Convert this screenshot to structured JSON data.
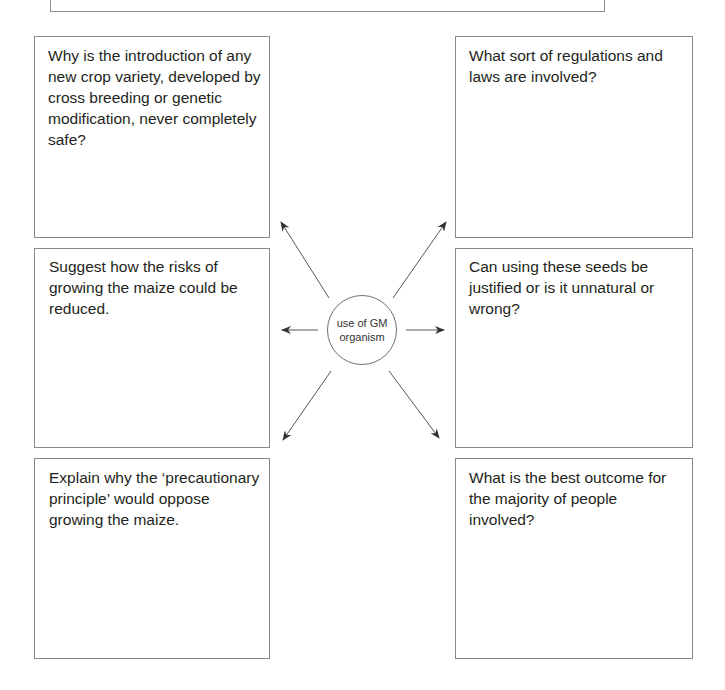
{
  "banner": {
    "text": ""
  },
  "center": {
    "label": "use of GM organism"
  },
  "boxes": {
    "top_left": {
      "question": "Why is the introduction of any new crop variety, developed by cross breeding or genetic modification, never completely safe?"
    },
    "top_right": {
      "question": "What sort of regulations and laws are involved?"
    },
    "middle_left": {
      "question": "Suggest how the risks of growing the maize could be reduced."
    },
    "middle_right": {
      "question": "Can using these seeds be justified or is it unnatural or wrong?"
    },
    "bottom_left": {
      "question": "Explain why the ‘precautionary principle’ would oppose growing the maize."
    },
    "bottom_right": {
      "question": "What is the best outcome for the majority of people involved?"
    }
  },
  "colors": {
    "border": "#8a8a8a",
    "text": "#231f20",
    "arrow": "#333333"
  }
}
